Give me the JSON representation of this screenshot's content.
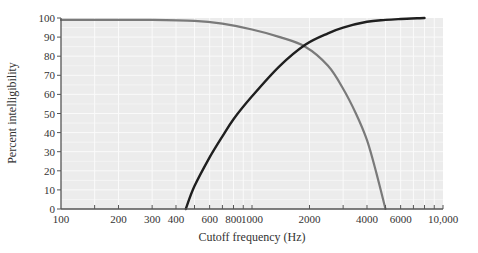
{
  "chart_data": {
    "type": "line",
    "title": "",
    "xlabel": "Cutoff frequency (Hz)",
    "ylabel": "Percent intelligibility",
    "xscale": "log",
    "xlim": [
      100,
      10000
    ],
    "ylim": [
      0,
      100
    ],
    "grid": true,
    "legend": null,
    "x_ticks": [
      100,
      200,
      300,
      400,
      600,
      800,
      1000,
      2000,
      4000,
      6000,
      10000
    ],
    "x_tick_labels": [
      "100",
      "200",
      "300",
      "400",
      "600",
      "800",
      "1000",
      "2000",
      "4000",
      "6000",
      "10,000"
    ],
    "x_minor_ticks": [
      150,
      500,
      700,
      900,
      3000,
      5000,
      7000,
      8000,
      9000
    ],
    "y_ticks": [
      0,
      10,
      20,
      30,
      40,
      50,
      60,
      70,
      80,
      90,
      100
    ],
    "y_tick_labels": [
      "0",
      "10",
      "20",
      "30",
      "40",
      "50",
      "60",
      "70",
      "80",
      "90",
      "100"
    ],
    "series": [
      {
        "name": "Low-pass filtered (frequencies below cutoff retained)",
        "color": "#7a7a7a",
        "x": [
          100,
          300,
          500,
          700,
          1000,
          1400,
          1900,
          2500,
          3000,
          3500,
          4000,
          4500,
          5000
        ],
        "y": [
          99,
          99,
          98.5,
          97,
          94,
          90,
          85,
          75,
          63,
          50,
          36,
          18,
          0
        ]
      },
      {
        "name": "High-pass filtered (frequencies above cutoff retained)",
        "color": "#1f1f1f",
        "x": [
          450,
          500,
          600,
          700,
          800,
          1000,
          1400,
          1900,
          2500,
          3000,
          4000,
          5000,
          6000,
          8000
        ],
        "y": [
          0,
          12,
          27,
          38,
          47,
          59,
          75,
          86,
          92,
          95,
          98,
          99,
          99.5,
          100
        ]
      }
    ]
  },
  "axes": {
    "x_title": "Cutoff frequency (Hz)",
    "y_title": "Percent intelligibility"
  },
  "colors": {
    "plot_background": "#ececec",
    "grid": "#fafafa",
    "axis": "#555555",
    "low_pass_line": "#7a7a7a",
    "high_pass_line": "#1f1f1f"
  }
}
